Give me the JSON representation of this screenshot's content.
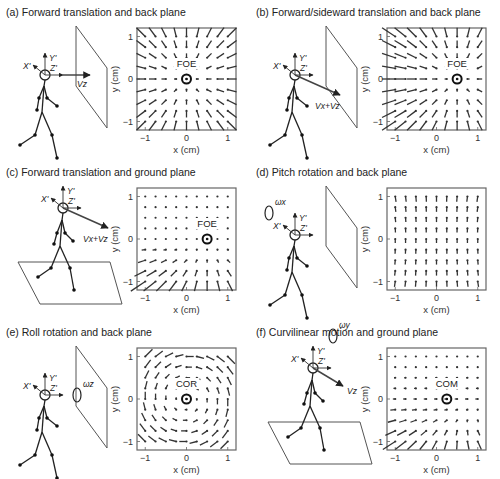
{
  "figure": {
    "panels": [
      {
        "id": "a",
        "title": "(a) Forward translation and back plane",
        "ox": 0,
        "oy": 0,
        "flow": "expand",
        "cx": 0,
        "cy": 0,
        "ann": "FOE",
        "scene": "back",
        "vel": "Vz",
        "velDir": "z",
        "rot": null
      },
      {
        "id": "b",
        "title": "(b) Forward/sideward translation and back plane",
        "ox": 250,
        "oy": 0,
        "flow": "expand",
        "cx": 0.5,
        "cy": 0,
        "ann": "FOE",
        "scene": "back",
        "vel": "Vx+Vz",
        "velDir": "xz",
        "rot": null
      },
      {
        "id": "c",
        "title": "(c) Forward translation and ground plane",
        "ox": 0,
        "oy": 160,
        "flow": "ground",
        "cx": 0.5,
        "cy": 0,
        "ann": "FOE",
        "scene": "ground",
        "vel": "Vx+Vz",
        "velDir": "xz",
        "rot": null
      },
      {
        "id": "d",
        "title": "(d) Pitch rotation and back plane",
        "ox": 250,
        "oy": 160,
        "flow": "pitch",
        "cx": null,
        "cy": null,
        "ann": "",
        "scene": "back",
        "vel": "",
        "velDir": "",
        "rot": "ωx"
      },
      {
        "id": "e",
        "title": "(e) Roll rotation and back plane",
        "ox": 0,
        "oy": 320,
        "flow": "roll",
        "cx": 0,
        "cy": 0,
        "ann": "COR",
        "scene": "back",
        "vel": "",
        "velDir": "",
        "rot": "ωz"
      },
      {
        "id": "f",
        "title": "(f) Curvilinear motion and ground plane",
        "ox": 250,
        "oy": 320,
        "flow": "curv",
        "cx": 0.25,
        "cy": 0,
        "ann": "COM",
        "scene": "ground",
        "vel": "Vz",
        "velDir": "tilt",
        "rot": "ωy"
      }
    ],
    "axes": {
      "xlabel": "x (cm)",
      "ylabel": "y (cm)",
      "xticks": [
        "−1",
        "0",
        "1"
      ],
      "yticks": [
        "1",
        "0",
        "−1"
      ],
      "range": [
        -1.2,
        1.2
      ]
    },
    "frame_labels": {
      "x": "X'",
      "y": "Y'",
      "z": "Z'"
    }
  },
  "chart_data": [
    {
      "type": "quiver",
      "title": "(a) Forward translation and back plane",
      "xlabel": "x (cm)",
      "ylabel": "y (cm)",
      "xlim": [
        -1.2,
        1.2
      ],
      "ylim": [
        -1.2,
        1.2
      ],
      "grid_points": "9x9 from -1 to 1",
      "pattern": "radial expansion",
      "singular_point": {
        "label": "FOE",
        "x": 0,
        "y": 0
      }
    },
    {
      "type": "quiver",
      "title": "(b) Forward/sideward translation and back plane",
      "xlabel": "x (cm)",
      "ylabel": "y (cm)",
      "xlim": [
        -1.2,
        1.2
      ],
      "ylim": [
        -1.2,
        1.2
      ],
      "grid_points": "9x9 from -1 to 1",
      "pattern": "radial expansion",
      "singular_point": {
        "label": "FOE",
        "x": 0.5,
        "y": 0
      }
    },
    {
      "type": "quiver",
      "title": "(c) Forward translation and ground plane",
      "xlabel": "x (cm)",
      "ylabel": "y (cm)",
      "xlim": [
        -1.2,
        1.2
      ],
      "ylim": [
        -1.2,
        1.2
      ],
      "grid_points": "9x9 from -1 to 1",
      "pattern": "expansion below horizon only",
      "singular_point": {
        "label": "FOE",
        "x": 0.5,
        "y": 0
      }
    },
    {
      "type": "quiver",
      "title": "(d) Pitch rotation and back plane",
      "xlabel": "x (cm)",
      "ylabel": "y (cm)",
      "xlim": [
        -1.2,
        1.2
      ],
      "ylim": [
        -1.2,
        1.2
      ],
      "grid_points": "9x9 from -1 to 1",
      "pattern": "uniform downward flow"
    },
    {
      "type": "quiver",
      "title": "(e) Roll rotation and back plane",
      "xlabel": "x (cm)",
      "ylabel": "y (cm)",
      "xlim": [
        -1.2,
        1.2
      ],
      "ylim": [
        -1.2,
        1.2
      ],
      "grid_points": "9x9 from -1 to 1",
      "pattern": "rotational (clockwise)",
      "singular_point": {
        "label": "COR",
        "x": 0,
        "y": 0
      }
    },
    {
      "type": "quiver",
      "title": "(f) Curvilinear motion and ground plane",
      "xlabel": "x (cm)",
      "ylabel": "y (cm)",
      "xlim": [
        -1.2,
        1.2
      ],
      "ylim": [
        -1.2,
        1.2
      ],
      "grid_points": "9x9 from -1 to 1",
      "pattern": "curvilinear ground flow",
      "singular_point": {
        "label": "COM",
        "x": 0.25,
        "y": 0
      }
    }
  ]
}
